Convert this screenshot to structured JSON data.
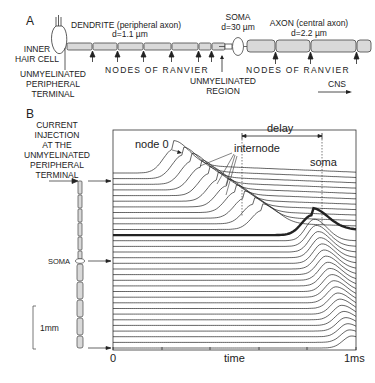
{
  "panel_a": {
    "letter": "A",
    "inner_hair_cell": [
      "INNER",
      "HAIR CELL"
    ],
    "dendrite_title": "DENDRITE (peripheral axon)",
    "dendrite_diameter": "d=1.1 µm",
    "soma_title": "SOMA",
    "soma_diameter": "d=30 µm",
    "axon_title": "AXON (central axon)",
    "axon_diameter": "d=2.2 µm",
    "unmyelinated_terminal": [
      "UNMYELINATED",
      "PERIPHERAL",
      "TERMINAL"
    ],
    "nodes_of_ranvier_1": "NODES OF RANVIER",
    "nodes_of_ranvier_2": "NODES OF RANVIER",
    "unmyelinated_region": [
      "UNMYELINATED",
      "REGION"
    ],
    "cns_label": "CNS",
    "colors": {
      "fiber_fill": "#d9d9d9",
      "stroke": "#333333"
    }
  },
  "panel_b": {
    "letter": "B",
    "current_injection": [
      "CURRENT",
      "INJECTION",
      "AT THE",
      "UNMYELINATED",
      "PERIPHERAL",
      "TERMINAL"
    ],
    "soma_label": "SOMA",
    "scale_bar_label": "1mm",
    "annotations": {
      "node0": "node 0",
      "internode": "internode",
      "delay": "delay",
      "soma": "soma"
    },
    "x_axis": {
      "start": "0",
      "label": "time",
      "end": "1ms"
    }
  },
  "chart_data": {
    "type": "line",
    "title": "",
    "xlabel": "time",
    "ylabel": "",
    "x_ticks": [
      "0",
      "time",
      "1ms"
    ],
    "xlim": [
      0,
      1
    ],
    "annotations": [
      "node 0",
      "internode",
      "delay",
      "soma"
    ],
    "series_count": 32
  }
}
